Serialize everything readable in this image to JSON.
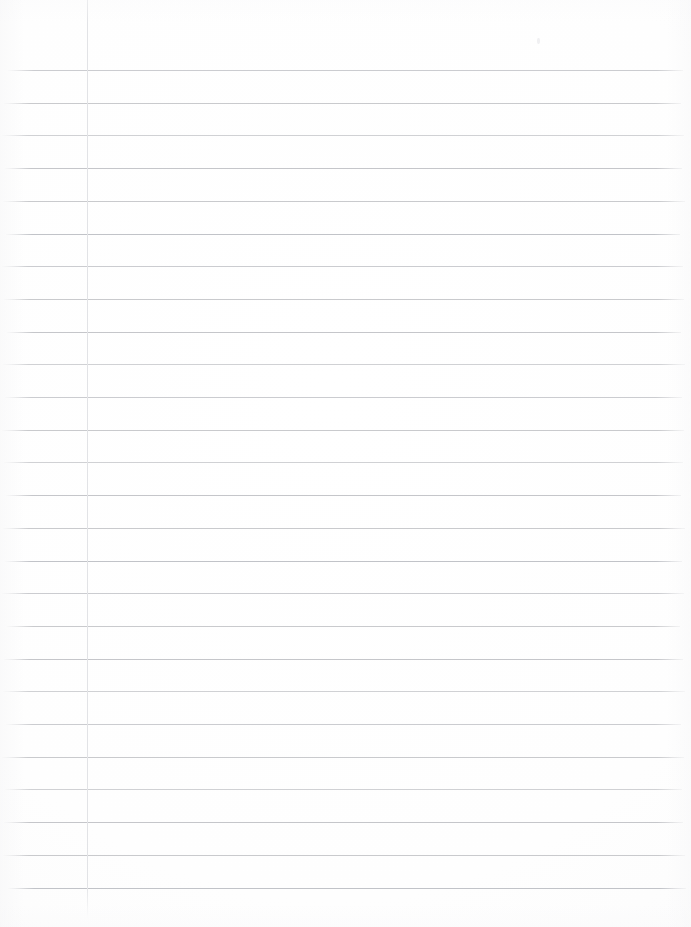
{
  "document": {
    "kind": "scanned-blank-ruled-paper",
    "title": "Blank Ruled Notebook Page",
    "visible_text": "",
    "page_width": 691,
    "page_height": 927,
    "background_color": "#fefefe"
  },
  "paper": {
    "rule_color": "#c9cacd",
    "rule_color_variants": [
      "#cbccd0",
      "#c5c6ca",
      "#d0d1d4",
      "#c1c3c8"
    ],
    "rule_thickness": 1,
    "rule_count": 26,
    "rule_spacing": 32.7,
    "first_rule_y": 70,
    "rule_left_x": 4,
    "rule_right_x": 686,
    "rule_positions_y": [
      70,
      102.7,
      135.4,
      168.1,
      200.8,
      233.5,
      266.2,
      298.9,
      331.6,
      364.3,
      397.0,
      429.7,
      462.4,
      495.1,
      527.8,
      560.5,
      593.2,
      625.9,
      658.6,
      691.3,
      724.0,
      756.7,
      789.4,
      822.1,
      854.8,
      888.0
    ],
    "rule_tone_cycle": [
      "tone-a",
      "",
      "tone-c",
      "tone-b",
      "",
      "tone-d",
      "tone-a",
      "",
      "tone-b",
      "tone-c"
    ],
    "rule_inset_left": [
      8,
      4,
      2,
      5,
      3,
      6,
      2,
      4,
      7,
      3,
      5,
      2,
      4,
      6,
      3,
      5,
      2,
      7,
      4,
      3,
      6,
      2,
      5,
      4,
      3,
      8
    ],
    "rule_inset_right": [
      8,
      10,
      7,
      9,
      6,
      11,
      8,
      7,
      10,
      6,
      9,
      7,
      8,
      10,
      6,
      9,
      7,
      11,
      8,
      6,
      10,
      7,
      9,
      8,
      6,
      5
    ]
  },
  "margin": {
    "label": "left margin rule",
    "color": "#e2e3e6",
    "x": 87,
    "top_y": 0,
    "bottom_y": 919,
    "thickness": 1
  },
  "artifacts": {
    "speck": {
      "x": 537,
      "y": 38,
      "color": "#f0f0f2"
    }
  }
}
